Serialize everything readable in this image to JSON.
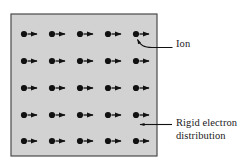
{
  "figure": {
    "type": "physics-lattice-diagram",
    "canvas": {
      "width": 241,
      "height": 168,
      "background": "#ffffff"
    },
    "medium_box": {
      "name": "rigid-electron-distribution-region",
      "x": 11,
      "y": 14,
      "width": 146,
      "height": 142,
      "fill": "#d2d2d2",
      "stroke": "#4a4a4a",
      "stroke_width": 1.2
    },
    "lattice": {
      "rows": 5,
      "columns": 5,
      "row_y": [
        34,
        61,
        88,
        115,
        141
      ],
      "column_x": [
        24,
        52,
        80,
        108,
        136
      ],
      "ion_dot": {
        "name": "ion-dot",
        "radius": 3.1,
        "color": "#111111"
      },
      "displacement_arrow": {
        "name": "displacement-arrow",
        "direction": "right",
        "length": 13,
        "color": "#111111",
        "stroke_width": 1.3,
        "head_length": 4.2,
        "head_half_width": 2.6
      }
    },
    "annotations": [
      {
        "id": "ion",
        "label": "Ion",
        "name": "annotation-ion",
        "text_x": 176,
        "text_y": 38,
        "leader": {
          "name": "ion-leader-line",
          "type": "curved",
          "path": "M 172.5 47.5 L 152 47.5 C 144 47.5 140.5 45.5 137.5 39.5",
          "arrow_at": {
            "x": 136.6,
            "y": 37.6
          },
          "arrow_angle_deg": 245,
          "color": "#111111",
          "stroke_width": 1.1
        }
      },
      {
        "id": "rigid_electron_distribution",
        "label_line_1": "Rigid electron",
        "label_line_2": "distribution",
        "name": "annotation-rigid-electron-distribution",
        "text_x": 176,
        "text_y": 117,
        "leader": {
          "name": "rigid-electron-leader-line",
          "type": "straight",
          "path": "M 172 124.5 L 140 124.5",
          "arrow_at": {
            "x": 137.5,
            "y": 124.5
          },
          "arrow_angle_deg": 180,
          "color": "#111111",
          "stroke_width": 1.1
        }
      }
    ]
  },
  "chart_data": {
    "type": "scatter",
    "title": "",
    "xlabel": "",
    "ylabel": "",
    "legend": [
      "Ion",
      "Rigid electron distribution"
    ],
    "grid": false,
    "series": [
      {
        "name": "Ion",
        "marker": "filled-circle",
        "points": [
          {
            "x": 24,
            "y": 34
          },
          {
            "x": 52,
            "y": 34
          },
          {
            "x": 80,
            "y": 34
          },
          {
            "x": 108,
            "y": 34
          },
          {
            "x": 136,
            "y": 34
          },
          {
            "x": 24,
            "y": 61
          },
          {
            "x": 52,
            "y": 61
          },
          {
            "x": 80,
            "y": 61
          },
          {
            "x": 108,
            "y": 61
          },
          {
            "x": 136,
            "y": 61
          },
          {
            "x": 24,
            "y": 88
          },
          {
            "x": 52,
            "y": 88
          },
          {
            "x": 80,
            "y": 88
          },
          {
            "x": 108,
            "y": 88
          },
          {
            "x": 136,
            "y": 88
          },
          {
            "x": 24,
            "y": 115
          },
          {
            "x": 52,
            "y": 115
          },
          {
            "x": 80,
            "y": 115
          },
          {
            "x": 108,
            "y": 115
          },
          {
            "x": 136,
            "y": 115
          },
          {
            "x": 24,
            "y": 141
          },
          {
            "x": 52,
            "y": 141
          },
          {
            "x": 80,
            "y": 141
          },
          {
            "x": 108,
            "y": 141
          },
          {
            "x": 136,
            "y": 141
          }
        ]
      },
      {
        "name": "Displacement vector",
        "marker": "arrow-right",
        "uniform_vector": {
          "dx": 13,
          "dy": 0
        },
        "count": 25
      }
    ]
  }
}
